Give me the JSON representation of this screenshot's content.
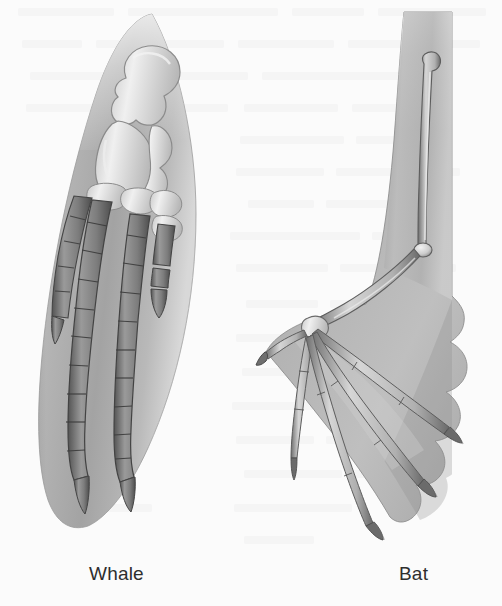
{
  "figure": {
    "background_color": "#fbfbfb",
    "caption_color": "#2e2e2e",
    "width": 502,
    "height": 606
  },
  "specimens": [
    {
      "id": "whale",
      "label": "Whale",
      "limb_type": "flipper",
      "label_position": {
        "x": 89,
        "y": 563
      },
      "soft_tissue_color": "#a9a9a9",
      "bone_fill_light": "#cfcfcf",
      "bone_fill_dark": "#7a7a7a",
      "bone_outline": "#4a4a4a",
      "bones": [
        {
          "name": "humerus",
          "style": "light-knobbed"
        },
        {
          "name": "radius-ulna",
          "style": "light-paired"
        },
        {
          "name": "carpals",
          "style": "light-blocks"
        },
        {
          "name": "digit-1",
          "style": "short-tapered"
        },
        {
          "name": "digit-2",
          "style": "long-segmented"
        },
        {
          "name": "digit-3",
          "style": "long-segmented"
        },
        {
          "name": "digit-4",
          "style": "short-segmented"
        }
      ]
    },
    {
      "id": "bat",
      "label": "Bat",
      "limb_type": "wing",
      "label_position": {
        "x": 399,
        "y": 563
      },
      "soft_tissue_color": "#b0b0b0",
      "membrane_color": "#b4b4b4",
      "bone_fill_light": "#d2d2d2",
      "bone_outline": "#5a5a5a",
      "bones": [
        {
          "name": "humerus",
          "style": "slender-vertical"
        },
        {
          "name": "radius",
          "style": "slender-diagonal"
        },
        {
          "name": "carpals",
          "style": "light-knot"
        },
        {
          "name": "thumb",
          "style": "short-clawed"
        },
        {
          "name": "digit-2",
          "style": "elongated"
        },
        {
          "name": "digit-3",
          "style": "elongated"
        },
        {
          "name": "digit-4",
          "style": "elongated"
        },
        {
          "name": "digit-5",
          "style": "elongated"
        }
      ]
    }
  ]
}
